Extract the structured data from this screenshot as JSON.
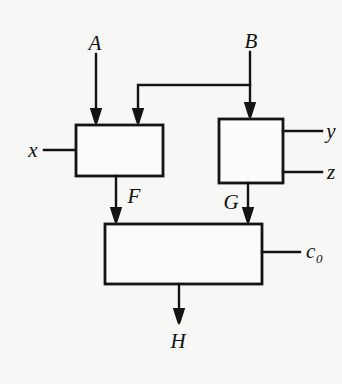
{
  "figure": {
    "background_color": "#f7f7f5",
    "line_color": "#141414",
    "block_fill": "#fbfbf9"
  },
  "labels": {
    "input_a": "A",
    "input_b": "B",
    "input_x": "x",
    "output_y": "y",
    "output_z": "z",
    "signal_f": "F",
    "signal_g": "G",
    "input_c0_base": "c",
    "input_c0_sub": "0",
    "output_h": "H"
  },
  "blocks": [
    {
      "name": "left-block",
      "x": 76,
      "y": 125,
      "width": 87,
      "height": 51
    },
    {
      "name": "right-block",
      "x": 219,
      "y": 119,
      "width": 64,
      "height": 64
    },
    {
      "name": "bottom-block",
      "x": 105,
      "y": 224,
      "width": 157,
      "height": 60
    }
  ],
  "connections": [
    {
      "name": "a-to-left-block",
      "from": "A",
      "to": "left-block",
      "kind": "arrow"
    },
    {
      "name": "b-to-right-block",
      "from": "B",
      "to": "right-block",
      "kind": "arrow"
    },
    {
      "name": "b-branch-to-left-block",
      "from": "B",
      "to": "left-block",
      "kind": "arrow"
    },
    {
      "name": "x-to-left-block",
      "from": "x",
      "to": "left-block",
      "kind": "line"
    },
    {
      "name": "right-block-to-y",
      "from": "right-block",
      "to": "y",
      "kind": "line"
    },
    {
      "name": "right-block-to-z",
      "from": "right-block",
      "to": "z",
      "kind": "line"
    },
    {
      "name": "left-block-to-bottom-block",
      "from": "left-block",
      "to": "bottom-block",
      "signal": "F",
      "kind": "arrow"
    },
    {
      "name": "right-block-to-bottom-block",
      "from": "right-block",
      "to": "bottom-block",
      "signal": "G",
      "kind": "arrow"
    },
    {
      "name": "c0-to-bottom-block",
      "from": "c0",
      "to": "bottom-block",
      "kind": "line"
    },
    {
      "name": "bottom-block-to-h",
      "from": "bottom-block",
      "to": "H",
      "kind": "arrow"
    }
  ]
}
